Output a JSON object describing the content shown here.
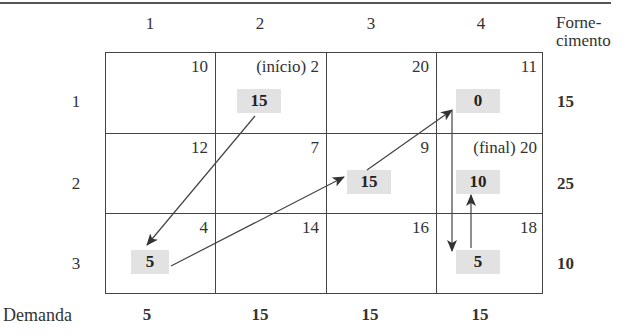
{
  "header": {
    "columns": [
      "1",
      "2",
      "3",
      "4"
    ],
    "supply_label": "Forne-\ncimento",
    "demand_label": "Demanda"
  },
  "rows": [
    {
      "label": "1",
      "supply": "15",
      "cells": [
        {
          "cost": "10",
          "alloc": ""
        },
        {
          "cost": "(início) 2",
          "alloc": "15"
        },
        {
          "cost": "20",
          "alloc": ""
        },
        {
          "cost": "11",
          "alloc": "0"
        }
      ]
    },
    {
      "label": "2",
      "supply": "25",
      "cells": [
        {
          "cost": "12",
          "alloc": ""
        },
        {
          "cost": "7",
          "alloc": ""
        },
        {
          "cost": "9",
          "alloc": "15"
        },
        {
          "cost": "(final) 20",
          "alloc": "10"
        }
      ]
    },
    {
      "label": "3",
      "supply": "10",
      "cells": [
        {
          "cost": "4",
          "alloc": "5"
        },
        {
          "cost": "14",
          "alloc": ""
        },
        {
          "cost": "16",
          "alloc": ""
        },
        {
          "cost": "18",
          "alloc": "5"
        }
      ]
    }
  ],
  "demand": [
    "5",
    "15",
    "15",
    "15"
  ],
  "path": [
    "(1,2)",
    "(3,1)",
    "(2,3)",
    "(1,4)",
    "(3,4)",
    "(2,4)"
  ],
  "colors": {
    "alloc_bg": "#e2e2e2",
    "line": "#444444"
  }
}
